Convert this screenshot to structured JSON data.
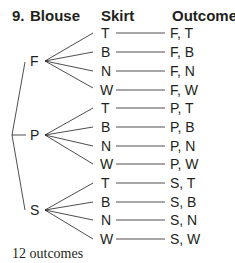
{
  "partial_line": "2. Outcomes",
  "header": {
    "number": "9.",
    "col1": "Blouse",
    "col2": "Skirt",
    "col3": "Outcome"
  },
  "root_labels": [
    "F",
    "P",
    "S"
  ],
  "skirts": [
    "T",
    "B",
    "N",
    "W"
  ],
  "outcomes": [
    [
      "F, T",
      "F, B",
      "F, N",
      "F, W"
    ],
    [
      "P, T",
      "P, B",
      "P, N",
      "P, W"
    ],
    [
      "S, T",
      "S, B",
      "S, N",
      "S, W"
    ]
  ],
  "footer": "12 outcomes"
}
